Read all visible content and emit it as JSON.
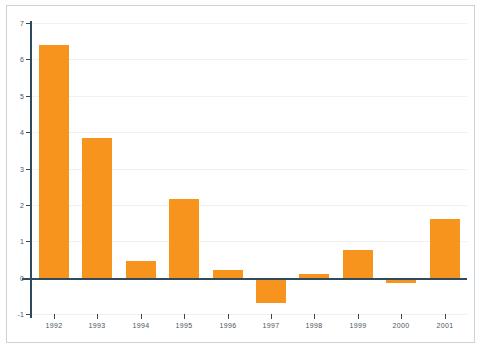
{
  "chart_data": {
    "type": "bar",
    "title": "",
    "subtitle": "",
    "xlabel": "",
    "ylabel": "",
    "categories": [
      "1992",
      "1993",
      "1994",
      "1995",
      "1996",
      "1997",
      "1998",
      "1999",
      "2000",
      "2001"
    ],
    "values": [
      6.4,
      3.85,
      0.45,
      2.15,
      0.2,
      -0.7,
      0.1,
      0.75,
      -0.15,
      1.6
    ],
    "series": [
      {
        "name": "",
        "values": [
          6.4,
          3.85,
          0.45,
          2.15,
          0.2,
          -0.7,
          0.1,
          0.75,
          -0.15,
          1.6
        ]
      }
    ],
    "ylim": [
      -1,
      7
    ],
    "yticks": [
      7,
      6,
      5,
      4,
      3,
      2,
      1,
      0,
      -1
    ],
    "ytick_labels": [
      "7",
      "6",
      "5",
      "4",
      "3",
      "2",
      "1",
      "0",
      "-1"
    ],
    "grid": true,
    "grid_axis": "y",
    "legend": false,
    "legend_position": "none",
    "bar_color": "#f7941e",
    "axis_color": "#2e4a5c",
    "gridline_color": "#f0f1f3",
    "background_color": "#ffffff",
    "frame_color": "#c9d2d8",
    "annotations": []
  }
}
